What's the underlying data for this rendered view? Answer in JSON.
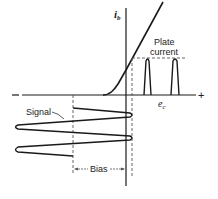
{
  "diagram": {
    "type": "class-c-amplifier-transfer-characteristic",
    "labels": {
      "y_axis": "i",
      "y_axis_sub": "b",
      "x_axis": "e",
      "x_axis_sub": "c",
      "plus": "+",
      "minus": "–",
      "plate_current_line1": "Plate",
      "plate_current_line2": "current",
      "signal": "Signal",
      "bias": "Bias"
    },
    "colors": {
      "line": "#1a1a1a",
      "dashed": "#555555",
      "background": "#ffffff"
    }
  }
}
